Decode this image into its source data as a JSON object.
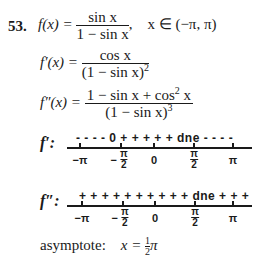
{
  "problem": {
    "number": "53.",
    "f": {
      "lhs": "f(x) =",
      "numerator": "sin x",
      "denominator": "1 − sin x",
      "comma": ",",
      "domain": "x ∈ (−π, π)"
    },
    "f_prime": {
      "lhs": "f′(x) =",
      "numerator": "cos x",
      "denominator": "(1 − sin x)",
      "denominator_exp": "2"
    },
    "f_double_prime": {
      "lhs": "f″(x) =",
      "numerator": "1 − sin x + cos",
      "numerator_exp": "2",
      "numerator_tail": " x",
      "denominator": "(1 − sin x)",
      "denominator_exp": "3"
    },
    "sign_chart_f_prime": {
      "label": "f′:",
      "signs": "- - - -  0 + + + + +  dne - - - -",
      "ticks": [
        {
          "label": "−π"
        },
        {
          "label_num": "π",
          "label_den": "2",
          "prefix": "−"
        },
        {
          "label": "0"
        },
        {
          "label_num": "π",
          "label_den": "2",
          "prefix": ""
        },
        {
          "label": "π"
        }
      ]
    },
    "sign_chart_f_double_prime": {
      "label": "f″:",
      "signs": "+ + + + + + + + + +  dne + + +",
      "ticks": [
        {
          "label": "−π"
        },
        {
          "label_num": "π",
          "label_den": "2",
          "prefix": "−"
        },
        {
          "label": "0"
        },
        {
          "label_num": "π",
          "label_den": "2",
          "prefix": ""
        },
        {
          "label": "π"
        }
      ]
    },
    "asymptote": {
      "label": "asymptote:",
      "lhs": "x =",
      "frac_num": "1",
      "frac_den": "2",
      "tail": "π"
    }
  }
}
